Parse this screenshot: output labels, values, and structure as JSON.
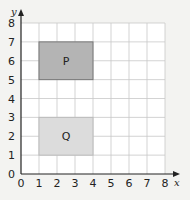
{
  "chart_data": {
    "type": "diagram-grid",
    "title": "",
    "xlabel": "x",
    "ylabel": "y",
    "xlim": [
      0,
      8
    ],
    "ylim": [
      0,
      8
    ],
    "grid": true,
    "x_ticks": [
      "0",
      "1",
      "2",
      "3",
      "4",
      "5",
      "6",
      "7",
      "8"
    ],
    "y_ticks": [
      "0",
      "1",
      "2",
      "3",
      "4",
      "5",
      "6",
      "7",
      "8"
    ],
    "shapes": [
      {
        "label": "P",
        "type": "rectangle",
        "x0": 1,
        "y0": 5,
        "x1": 4,
        "y1": 7,
        "fill": "#b4b4b4",
        "stroke": "#777777"
      },
      {
        "label": "Q",
        "type": "rectangle",
        "x0": 1,
        "y0": 1,
        "x1": 4,
        "y1": 3,
        "fill": "#dcdcdc",
        "stroke": "#bbbbbb"
      }
    ]
  },
  "colors": {
    "background": "#f3f3f1",
    "grid_bg": "#ffffff",
    "grid_line": "#c8c8c8",
    "axis": "#222222"
  }
}
